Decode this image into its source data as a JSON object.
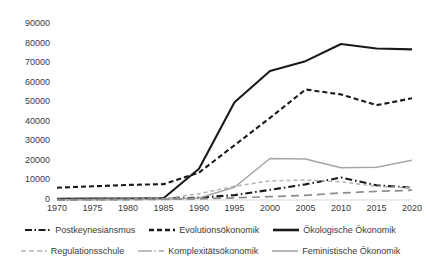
{
  "chart_data": {
    "type": "line",
    "title": "",
    "xlabel": "",
    "ylabel": "",
    "x": [
      1970,
      1975,
      1980,
      1985,
      1990,
      1995,
      2000,
      2005,
      2010,
      2015,
      2020
    ],
    "xlim": [
      1970,
      2020
    ],
    "ylim": [
      0,
      90000
    ],
    "y_ticks": [
      "0",
      "10000",
      "20000",
      "30000",
      "40000",
      "50000",
      "60000",
      "70000",
      "80000",
      "90000"
    ],
    "x_ticks": [
      "1970",
      "1975",
      "1980",
      "1985",
      "1990",
      "1995",
      "2000",
      "2005",
      "2010",
      "2015",
      "2020"
    ],
    "grid": false,
    "legend_position": "bottom",
    "series": [
      {
        "name": "Postkeynesiansmus",
        "style": "dash-dot",
        "color": "#1a1a1a",
        "values": [
          300,
          400,
          500,
          700,
          1200,
          2500,
          5200,
          8000,
          11500,
          7500,
          6300
        ]
      },
      {
        "name": "Evolutionsökonomik",
        "style": "dashed",
        "color": "#1a1a1a",
        "values": [
          6300,
          7000,
          7700,
          8100,
          14000,
          28000,
          42000,
          56500,
          54000,
          48500,
          52000
        ]
      },
      {
        "name": "Ökologische Ökonomik",
        "style": "solid",
        "color": "#1a1a1a",
        "values": [
          600,
          700,
          800,
          900,
          16000,
          50000,
          66000,
          71000,
          79800,
          77500,
          77000
        ]
      },
      {
        "name": "Regulationsschule",
        "style": "dashed-light",
        "color": "#b3b3b3",
        "values": [
          200,
          300,
          400,
          600,
          3200,
          7000,
          9800,
          10200,
          9300,
          7000,
          6200
        ]
      },
      {
        "name": "Komplexitätsökonomik",
        "style": "solid-dot-grey",
        "color": "#a6a6a6",
        "values": [
          150,
          200,
          250,
          350,
          1000,
          6500,
          21200,
          21000,
          16500,
          16800,
          20300
        ]
      },
      {
        "name": "Feministische Ökonomik",
        "style": "long-dash-grey",
        "color": "#8c8c8c",
        "values": [
          150,
          180,
          220,
          300,
          600,
          1100,
          1700,
          2400,
          3600,
          4400,
          5000
        ]
      }
    ]
  },
  "legend": {
    "rows": [
      [
        {
          "label": "Postkeynesiansmus",
          "swatch": "dash-dot-swatch"
        },
        {
          "label": "Evolutionsökonomik",
          "swatch": "dashed-swatch"
        },
        {
          "label": "Ökologische Ökonomik",
          "swatch": "solid-swatch"
        }
      ],
      [
        {
          "label": "Regulationsschule",
          "swatch": "dashed-light-swatch"
        },
        {
          "label": "Komplexitätsökonomik",
          "swatch": "solid-dot-grey-swatch"
        },
        {
          "label": "Feministische Ökonomik",
          "swatch": "long-dash-grey-swatch"
        }
      ]
    ]
  },
  "colors": {
    "axis": "#d9d9d9",
    "tick_text": "#3a3a3a",
    "dark_line": "#1a1a1a",
    "mid_grey_line": "#a6a6a6",
    "light_grey_line": "#b3b3b3"
  }
}
